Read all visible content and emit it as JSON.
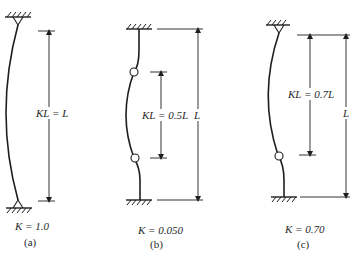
{
  "diagram": {
    "type": "effective-length-columns",
    "line_color": "#1e1e1e",
    "panels": [
      {
        "id": "a",
        "top_support": "pinned",
        "bottom_support": "pinned",
        "effective_length_label": "KL = L",
        "k_label": "K = 1.0",
        "caption": "(a)"
      },
      {
        "id": "b",
        "top_support": "fixed",
        "bottom_support": "fixed",
        "effective_length_label": "KL = 0.5L",
        "length_label": "L",
        "k_label": "K = 0.050",
        "caption": "(b)"
      },
      {
        "id": "c",
        "top_support": "pinned",
        "bottom_support": "fixed",
        "effective_length_label": "KL = 0.7L",
        "length_label": "L",
        "k_label": "K = 0.70",
        "caption": "(c)"
      }
    ]
  }
}
